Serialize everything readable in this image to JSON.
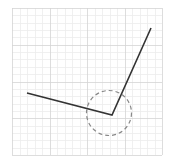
{
  "canvas": {
    "width": 173,
    "height": 165,
    "background": "#ffffff"
  },
  "grid": {
    "x0": 12,
    "y0": 8,
    "x1": 162,
    "y1": 155,
    "major_cols": 4,
    "major_rows": 4,
    "minor_per_major": 5,
    "major_color": "#d4d4d4",
    "minor_color": "#ececec"
  },
  "polyline": {
    "points": [
      [
        27,
        93
      ],
      [
        112,
        115
      ],
      [
        151,
        28
      ]
    ],
    "stroke": "#333333",
    "stroke_width": 1.6
  },
  "circle": {
    "cx": 109,
    "cy": 113,
    "r": 22.5,
    "stroke": "#888888",
    "stroke_width": 1.2,
    "dasharray": "4 3"
  }
}
